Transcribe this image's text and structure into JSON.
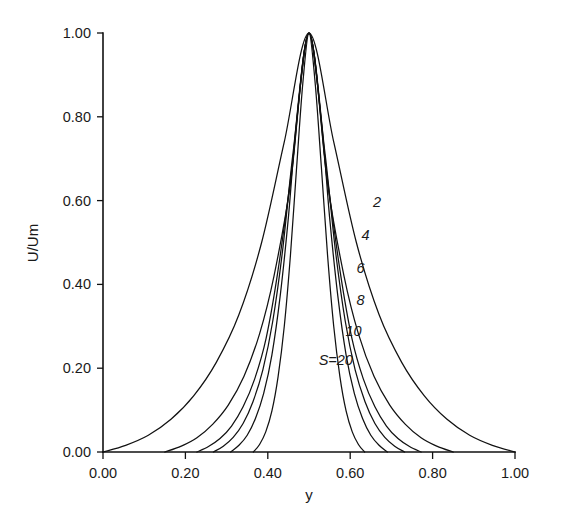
{
  "chart_data": {
    "type": "line",
    "title": "",
    "subtitle": "",
    "xlabel": "y",
    "ylabel": "U/Um",
    "xlim": [
      0.0,
      1.0
    ],
    "ylim": [
      0.0,
      1.0
    ],
    "grid": false,
    "legend_position": "inline-curve-labels",
    "xticks": [
      "0.00",
      "0.20",
      "0.40",
      "0.60",
      "0.80",
      "1.00"
    ],
    "xtick_values": [
      0.0,
      0.2,
      0.4,
      0.6,
      0.8,
      1.0
    ],
    "yticks": [
      "0.00",
      "0.20",
      "0.40",
      "0.60",
      "0.80",
      "1.00"
    ],
    "ytick_values": [
      0.0,
      0.2,
      0.4,
      0.6,
      0.8,
      1.0
    ],
    "annotations": [
      {
        "text": "2",
        "x": 0.665,
        "y": 0.585
      },
      {
        "text": "4",
        "x": 0.637,
        "y": 0.507
      },
      {
        "text": "6",
        "x": 0.625,
        "y": 0.428
      },
      {
        "text": "8",
        "x": 0.625,
        "y": 0.352
      },
      {
        "text": "10",
        "x": 0.608,
        "y": 0.278
      },
      {
        "text": "S=20",
        "x": 0.565,
        "y": 0.208
      }
    ],
    "series": [
      {
        "name": "S=20",
        "label": "S=20",
        "S": 20,
        "x": [
          0.365,
          0.38,
          0.395,
          0.41,
          0.425,
          0.44,
          0.455,
          0.47,
          0.485,
          0.5,
          0.515,
          0.53,
          0.545,
          0.56,
          0.575,
          0.59,
          0.605,
          0.62,
          0.635
        ],
        "y": [
          0.0,
          0.018,
          0.048,
          0.098,
          0.18,
          0.3,
          0.47,
          0.68,
          0.88,
          1.0,
          0.88,
          0.68,
          0.47,
          0.3,
          0.18,
          0.098,
          0.048,
          0.018,
          0.0
        ]
      },
      {
        "name": "S=10",
        "label": "10",
        "S": 10,
        "x": [
          0.31,
          0.33,
          0.35,
          0.37,
          0.39,
          0.41,
          0.43,
          0.45,
          0.47,
          0.5,
          0.53,
          0.55,
          0.57,
          0.59,
          0.61,
          0.63,
          0.65,
          0.67,
          0.69
        ],
        "y": [
          0.0,
          0.016,
          0.04,
          0.08,
          0.14,
          0.232,
          0.372,
          0.56,
          0.79,
          1.0,
          0.79,
          0.56,
          0.372,
          0.232,
          0.14,
          0.08,
          0.04,
          0.016,
          0.0
        ]
      },
      {
        "name": "S=8",
        "label": "8",
        "S": 8,
        "x": [
          0.268,
          0.292,
          0.316,
          0.34,
          0.364,
          0.388,
          0.412,
          0.436,
          0.462,
          0.5,
          0.538,
          0.564,
          0.588,
          0.612,
          0.636,
          0.66,
          0.684,
          0.708,
          0.732
        ],
        "y": [
          0.0,
          0.014,
          0.035,
          0.068,
          0.12,
          0.196,
          0.312,
          0.482,
          0.72,
          1.0,
          0.72,
          0.482,
          0.312,
          0.196,
          0.12,
          0.068,
          0.035,
          0.014,
          0.0
        ]
      },
      {
        "name": "S=6",
        "label": "6",
        "S": 6,
        "x": [
          0.228,
          0.256,
          0.284,
          0.312,
          0.34,
          0.368,
          0.396,
          0.424,
          0.458,
          0.5,
          0.542,
          0.576,
          0.604,
          0.632,
          0.66,
          0.688,
          0.716,
          0.744,
          0.772
        ],
        "y": [
          0.0,
          0.013,
          0.032,
          0.062,
          0.108,
          0.174,
          0.272,
          0.428,
          0.672,
          1.0,
          0.672,
          0.428,
          0.272,
          0.174,
          0.108,
          0.062,
          0.032,
          0.013,
          0.0
        ]
      },
      {
        "name": "S=4",
        "label": "4",
        "S": 4,
        "x": [
          0.15,
          0.19,
          0.228,
          0.266,
          0.304,
          0.342,
          0.38,
          0.415,
          0.455,
          0.5,
          0.545,
          0.585,
          0.62,
          0.658,
          0.696,
          0.734,
          0.772,
          0.81,
          0.85
        ],
        "y": [
          0.0,
          0.014,
          0.034,
          0.066,
          0.112,
          0.18,
          0.282,
          0.42,
          0.64,
          1.0,
          0.64,
          0.42,
          0.282,
          0.18,
          0.112,
          0.066,
          0.034,
          0.014,
          0.0
        ]
      },
      {
        "name": "S=2",
        "label": "2",
        "S": 2,
        "x": [
          0.0,
          0.055,
          0.11,
          0.165,
          0.22,
          0.275,
          0.33,
          0.385,
          0.44,
          0.5,
          0.56,
          0.615,
          0.67,
          0.725,
          0.78,
          0.835,
          0.89,
          0.945,
          1.0
        ],
        "y": [
          0.0,
          0.016,
          0.04,
          0.078,
          0.134,
          0.214,
          0.328,
          0.5,
          0.74,
          1.0,
          0.74,
          0.5,
          0.328,
          0.214,
          0.134,
          0.078,
          0.04,
          0.016,
          0.0
        ]
      }
    ]
  },
  "figure": {
    "background_color": "#ffffff",
    "line_color": "#111111"
  }
}
